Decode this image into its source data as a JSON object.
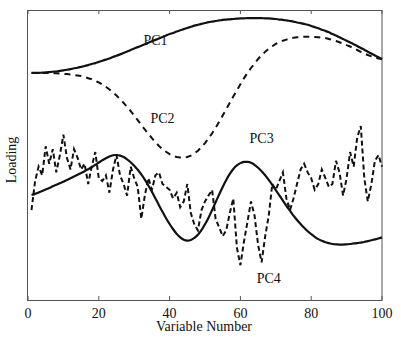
{
  "chart_data": {
    "type": "line",
    "title": "",
    "xlabel": "Variable Number",
    "ylabel": "Loading",
    "xlim": [
      0,
      100
    ],
    "ylim": [
      0,
      1
    ],
    "xticks": [
      0,
      20,
      40,
      60,
      80,
      100
    ],
    "yticks": [],
    "grid": false,
    "legend": "inline labels",
    "annotations": [
      {
        "text": "PC1",
        "x": 36,
        "y": 0.88
      },
      {
        "text": "PC2",
        "x": 38,
        "y": 0.61
      },
      {
        "text": "PC3",
        "x": 66,
        "y": 0.54
      },
      {
        "text": "PC4",
        "x": 68,
        "y": 0.06
      }
    ],
    "x": [
      1,
      2,
      3,
      4,
      5,
      6,
      7,
      8,
      9,
      10,
      11,
      12,
      13,
      14,
      15,
      16,
      17,
      18,
      19,
      20,
      21,
      22,
      23,
      24,
      25,
      26,
      27,
      28,
      29,
      30,
      31,
      32,
      33,
      34,
      35,
      36,
      37,
      38,
      39,
      40,
      41,
      42,
      43,
      44,
      45,
      46,
      47,
      48,
      49,
      50,
      51,
      52,
      53,
      54,
      55,
      56,
      57,
      58,
      59,
      60,
      61,
      62,
      63,
      64,
      65,
      66,
      67,
      68,
      69,
      70,
      71,
      72,
      73,
      74,
      75,
      76,
      77,
      78,
      79,
      80,
      81,
      82,
      83,
      84,
      85,
      86,
      87,
      88,
      89,
      90,
      91,
      92,
      93,
      94,
      95,
      96,
      97,
      98,
      99,
      100
    ],
    "series": [
      {
        "name": "PC1",
        "style": "solid",
        "values": [
          0.783,
          0.783,
          0.783,
          0.784,
          0.785,
          0.786,
          0.787,
          0.788,
          0.79,
          0.792,
          0.794,
          0.796,
          0.799,
          0.801,
          0.804,
          0.807,
          0.81,
          0.814,
          0.817,
          0.821,
          0.825,
          0.829,
          0.833,
          0.838,
          0.842,
          0.847,
          0.852,
          0.857,
          0.862,
          0.867,
          0.872,
          0.877,
          0.882,
          0.887,
          0.892,
          0.897,
          0.902,
          0.907,
          0.912,
          0.917,
          0.921,
          0.926,
          0.93,
          0.934,
          0.938,
          0.942,
          0.946,
          0.949,
          0.952,
          0.955,
          0.958,
          0.96,
          0.962,
          0.964,
          0.966,
          0.967,
          0.968,
          0.969,
          0.97,
          0.971,
          0.971,
          0.972,
          0.972,
          0.972,
          0.972,
          0.972,
          0.971,
          0.971,
          0.97,
          0.969,
          0.967,
          0.966,
          0.964,
          0.962,
          0.96,
          0.957,
          0.955,
          0.952,
          0.949,
          0.945,
          0.941,
          0.937,
          0.932,
          0.928,
          0.923,
          0.917,
          0.912,
          0.906,
          0.9,
          0.894,
          0.888,
          0.882,
          0.876,
          0.869,
          0.863,
          0.856,
          0.85,
          0.843,
          0.837,
          0.831
        ]
      },
      {
        "name": "PC2",
        "style": "dashed",
        "values": [
          0.783,
          0.783,
          0.783,
          0.783,
          0.783,
          0.783,
          0.782,
          0.782,
          0.781,
          0.78,
          0.779,
          0.778,
          0.776,
          0.774,
          0.772,
          0.769,
          0.765,
          0.761,
          0.756,
          0.75,
          0.743,
          0.735,
          0.726,
          0.716,
          0.705,
          0.693,
          0.68,
          0.666,
          0.651,
          0.636,
          0.62,
          0.604,
          0.588,
          0.573,
          0.558,
          0.544,
          0.531,
          0.52,
          0.511,
          0.503,
          0.497,
          0.493,
          0.491,
          0.491,
          0.493,
          0.498,
          0.505,
          0.515,
          0.527,
          0.541,
          0.557,
          0.575,
          0.594,
          0.615,
          0.636,
          0.658,
          0.68,
          0.702,
          0.723,
          0.744,
          0.764,
          0.783,
          0.8,
          0.816,
          0.831,
          0.844,
          0.856,
          0.866,
          0.875,
          0.883,
          0.889,
          0.894,
          0.898,
          0.902,
          0.904,
          0.906,
          0.907,
          0.908,
          0.908,
          0.908,
          0.907,
          0.906,
          0.905,
          0.903,
          0.9,
          0.897,
          0.893,
          0.889,
          0.884,
          0.879,
          0.874,
          0.868,
          0.862,
          0.856,
          0.85,
          0.845,
          0.84,
          0.836,
          0.833,
          0.831
        ]
      },
      {
        "name": "PC3",
        "style": "solid",
        "values": [
          0.362,
          0.366,
          0.371,
          0.376,
          0.381,
          0.386,
          0.392,
          0.397,
          0.403,
          0.408,
          0.414,
          0.42,
          0.426,
          0.432,
          0.438,
          0.444,
          0.451,
          0.458,
          0.466,
          0.474,
          0.482,
          0.489,
          0.495,
          0.499,
          0.5,
          0.498,
          0.493,
          0.485,
          0.475,
          0.463,
          0.449,
          0.433,
          0.415,
          0.395,
          0.373,
          0.35,
          0.327,
          0.304,
          0.282,
          0.262,
          0.244,
          0.228,
          0.216,
          0.208,
          0.205,
          0.207,
          0.214,
          0.225,
          0.241,
          0.261,
          0.284,
          0.31,
          0.337,
          0.364,
          0.39,
          0.414,
          0.435,
          0.452,
          0.464,
          0.472,
          0.476,
          0.476,
          0.473,
          0.466,
          0.456,
          0.444,
          0.43,
          0.414,
          0.397,
          0.379,
          0.361,
          0.343,
          0.325,
          0.308,
          0.291,
          0.276,
          0.262,
          0.249,
          0.237,
          0.227,
          0.218,
          0.21,
          0.204,
          0.199,
          0.196,
          0.193,
          0.192,
          0.191,
          0.191,
          0.192,
          0.193,
          0.195,
          0.196,
          0.198,
          0.2,
          0.203,
          0.206,
          0.209,
          0.212,
          0.216
        ]
      },
      {
        "name": "PC4",
        "style": "dashed",
        "values": [
          0.31,
          0.41,
          0.46,
          0.43,
          0.53,
          0.47,
          0.52,
          0.44,
          0.5,
          0.57,
          0.49,
          0.45,
          0.52,
          0.49,
          0.45,
          0.47,
          0.4,
          0.46,
          0.51,
          0.42,
          0.41,
          0.43,
          0.37,
          0.45,
          0.5,
          0.43,
          0.4,
          0.36,
          0.46,
          0.42,
          0.39,
          0.28,
          0.36,
          0.42,
          0.38,
          0.43,
          0.44,
          0.4,
          0.39,
          0.38,
          0.35,
          0.37,
          0.32,
          0.34,
          0.4,
          0.3,
          0.26,
          0.24,
          0.31,
          0.34,
          0.36,
          0.38,
          0.28,
          0.25,
          0.22,
          0.24,
          0.3,
          0.35,
          0.18,
          0.12,
          0.2,
          0.27,
          0.34,
          0.29,
          0.19,
          0.13,
          0.22,
          0.29,
          0.4,
          0.38,
          0.41,
          0.44,
          0.35,
          0.31,
          0.35,
          0.4,
          0.45,
          0.47,
          0.44,
          0.42,
          0.38,
          0.4,
          0.45,
          0.42,
          0.39,
          0.4,
          0.48,
          0.44,
          0.36,
          0.42,
          0.51,
          0.46,
          0.56,
          0.6,
          0.42,
          0.34,
          0.4,
          0.48,
          0.5,
          0.46
        ]
      }
    ]
  }
}
